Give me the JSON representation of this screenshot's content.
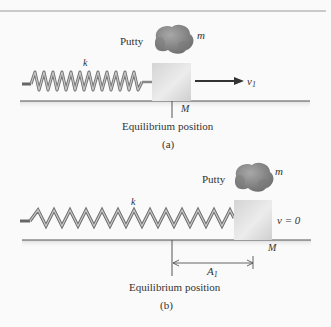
{
  "figure": {
    "top_rule": true,
    "panels": [
      {
        "id": "a",
        "caption": "(a)",
        "putty_label": "Putty",
        "putty_mass_label": "m",
        "spring_label": "k",
        "block_label": "M",
        "velocity_label": "v",
        "velocity_subscript": "1",
        "equilibrium_label": "Equilibrium position",
        "spring_state": "compressed",
        "spring_coils": 12
      },
      {
        "id": "b",
        "caption": "(b)",
        "putty_label": "Putty",
        "putty_mass_label": "m",
        "spring_label": "k",
        "block_label": "M",
        "velocity_label": "v = 0",
        "amplitude_label": "A",
        "amplitude_subscript": "1",
        "equilibrium_label": "Equilibrium position",
        "spring_state": "stretched",
        "spring_coils": 13
      }
    ],
    "colors": {
      "background": "#fafafa",
      "line": "#555555",
      "spring_light": "#b8b8b8",
      "spring_dark": "#707070",
      "block_light": "#e6e6e6",
      "block_dark": "#c8c8c8",
      "putty": "#8a8a8a",
      "arrow": "#333333"
    }
  }
}
